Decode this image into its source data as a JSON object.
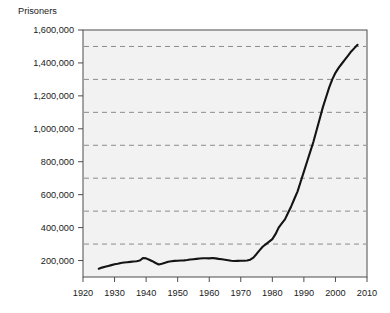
{
  "figure": {
    "y_axis_caption": "Prisoners",
    "plot_background_color": "#f2f2f2",
    "page_background_color": "#ffffff",
    "frame_color": "#4d4d4d",
    "gridline_color": "#8c8c8c",
    "line_color": "#141414",
    "tick_color": "#4d4d4d"
  },
  "chart_data": {
    "type": "line",
    "title": "",
    "subtitle": "",
    "xlabel": "",
    "ylabel": "Prisoners",
    "xlim": [
      1920,
      2010
    ],
    "ylim": [
      100000,
      1600000
    ],
    "grid": true,
    "grid_axis": "y",
    "legend": false,
    "legend_position": "none",
    "x_ticks": [
      1920,
      1930,
      1940,
      1950,
      1960,
      1970,
      1980,
      1990,
      2000,
      2010
    ],
    "x_tick_labels": [
      "1920",
      "1930",
      "1940",
      "1950",
      "1960",
      "1970",
      "1980",
      "1990",
      "2000",
      "2010"
    ],
    "y_ticks": [
      200000,
      400000,
      600000,
      800000,
      1000000,
      1200000,
      1400000,
      1600000
    ],
    "y_tick_labels": [
      "200,000",
      "400,000",
      "600,000",
      "800,000",
      "1,000,000",
      "1,200,000",
      "1,400,000",
      "1,600,000"
    ],
    "y_gridline_values": [
      300000,
      500000,
      700000,
      900000,
      1100000,
      1300000,
      1500000
    ],
    "series": [
      {
        "name": "Prisoners",
        "x": [
          1925,
          1926,
          1927,
          1928,
          1929,
          1930,
          1931,
          1932,
          1933,
          1934,
          1935,
          1936,
          1937,
          1938,
          1939,
          1940,
          1941,
          1942,
          1943,
          1944,
          1945,
          1946,
          1947,
          1948,
          1949,
          1950,
          1951,
          1952,
          1953,
          1954,
          1955,
          1956,
          1957,
          1958,
          1959,
          1960,
          1961,
          1962,
          1963,
          1964,
          1965,
          1966,
          1967,
          1968,
          1969,
          1970,
          1971,
          1972,
          1973,
          1974,
          1975,
          1976,
          1977,
          1978,
          1979,
          1980,
          1981,
          1982,
          1983,
          1984,
          1985,
          1986,
          1987,
          1988,
          1989,
          1990,
          1991,
          1992,
          1993,
          1994,
          1995,
          1996,
          1997,
          1998,
          1999,
          2000,
          2001,
          2002,
          2003,
          2004,
          2005,
          2006,
          2007
        ],
        "y": [
          150000,
          157000,
          162000,
          167000,
          172000,
          177000,
          180000,
          185000,
          188000,
          190000,
          192000,
          194000,
          196000,
          200000,
          215000,
          213000,
          205000,
          196000,
          185000,
          176000,
          180000,
          186000,
          193000,
          196000,
          198000,
          199000,
          200000,
          201000,
          203000,
          206000,
          208000,
          210000,
          212000,
          214000,
          214000,
          213000,
          215000,
          213000,
          210000,
          208000,
          205000,
          202000,
          199000,
          197000,
          198000,
          199000,
          199000,
          200000,
          205000,
          218000,
          240000,
          263000,
          285000,
          300000,
          315000,
          330000,
          360000,
          400000,
          425000,
          450000,
          490000,
          530000,
          575000,
          620000,
          680000,
          740000,
          800000,
          860000,
          920000,
          990000,
          1060000,
          1130000,
          1190000,
          1250000,
          1300000,
          1340000,
          1370000,
          1395000,
          1420000,
          1445000,
          1470000,
          1490000,
          1510000
        ]
      }
    ]
  }
}
